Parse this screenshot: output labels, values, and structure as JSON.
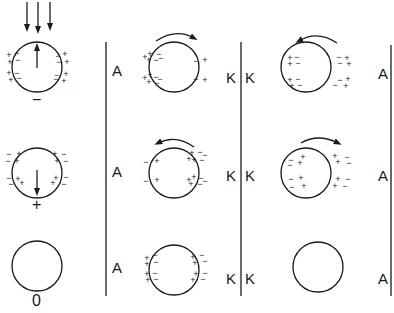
{
  "figure": {
    "colors": {
      "ink": "#1a1a1a",
      "background": "#ffffff"
    },
    "column1": {
      "rows": [
        {
          "net_charge_label": "−",
          "field_arrow": "up",
          "incoming_arrows": 3,
          "inner_charge": "−",
          "outer_charge": "+"
        },
        {
          "net_charge_label": "+",
          "field_arrow": "down",
          "inner_charge": "+",
          "outer_charge": "−"
        },
        {
          "net_charge_label": "0"
        }
      ]
    },
    "plates": {
      "anode_left_labels": [
        "A",
        "A",
        "A"
      ],
      "cathode_left_labels": [
        "K",
        "K",
        "K"
      ],
      "cathode_right_labels": [
        "K",
        "K",
        "K"
      ],
      "anode_right_labels": [
        "A",
        "A",
        "A"
      ]
    },
    "column2": {
      "rows": [
        {
          "rotation": "clockwise"
        },
        {
          "rotation": "counterclockwise"
        },
        {
          "rotation": "none"
        }
      ]
    },
    "column3": {
      "rows": [
        {
          "rotation": "counterclockwise"
        },
        {
          "rotation": "clockwise"
        },
        {
          "rotation": "none"
        }
      ]
    }
  }
}
